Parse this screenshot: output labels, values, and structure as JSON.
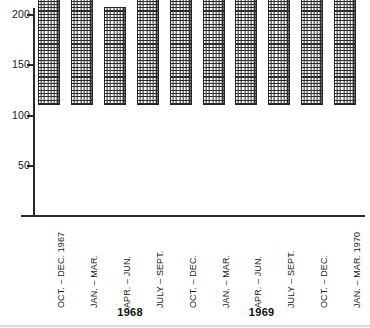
{
  "chart_data": {
    "type": "bar",
    "title": "",
    "subtitle": "",
    "xlabel": "",
    "ylabel": "",
    "ylim": [
      0,
      210
    ],
    "grid": false,
    "legend": null,
    "y_ticks": [
      50,
      100,
      150,
      200
    ],
    "categories": [
      "OCT. – DEC. 1967",
      "JAN. – MAR.",
      "APR. – JUN.",
      "JULY – SEPT.",
      "OCT. – DEC.",
      "JAN. – MAR.",
      "APR. – JUN.",
      "JULY – SEPT.",
      "OCT. – DEC.",
      "JAN. – MAR. 1970"
    ],
    "values": [
      145,
      158,
      98,
      110,
      163,
      166,
      173,
      119,
      178,
      190
    ],
    "group_labels": [
      {
        "text": "1968",
        "spans_categories": [
          1,
          2,
          3,
          4
        ]
      },
      {
        "text": "1969",
        "spans_categories": [
          5,
          6,
          7,
          8
        ]
      }
    ]
  },
  "style": {
    "axis_color": "#2a2a2a",
    "bar_outline": "#242424",
    "bar_fill": "#fbfbfb",
    "bar_hatch": "#2b2b2b",
    "text_color": "#1a1a1a",
    "background": "#ffffff"
  }
}
